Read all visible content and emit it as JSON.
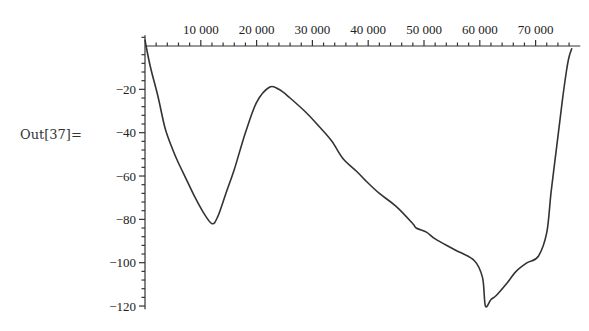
{
  "cell": {
    "out_label": "Out[37]="
  },
  "chart_data": {
    "type": "line",
    "title": "",
    "xlabel": "",
    "ylabel": "",
    "xlim": [
      0,
      78000
    ],
    "ylim": [
      -122,
      5
    ],
    "x_ticks": [
      10000,
      20000,
      30000,
      40000,
      50000,
      60000,
      70000
    ],
    "x_tick_labels": [
      "10 000",
      "20 000",
      "30 000",
      "40 000",
      "50 000",
      "60 000",
      "70 000"
    ],
    "y_ticks": [
      -20,
      -40,
      -60,
      -80,
      -100,
      -120
    ],
    "y_tick_labels": [
      "-20",
      "-40",
      "-60",
      "-80",
      "-100",
      "-120"
    ],
    "x_minor_step": 2000,
    "y_minor_step": 4,
    "grid": false,
    "legend": null,
    "series": [
      {
        "name": "curve",
        "color": "#333333",
        "points": [
          [
            0,
            3
          ],
          [
            200,
            0
          ],
          [
            1000,
            -10
          ],
          [
            2300,
            -23
          ],
          [
            3600,
            -38
          ],
          [
            5000,
            -48
          ],
          [
            6000,
            -54
          ],
          [
            7500,
            -62
          ],
          [
            9000,
            -70
          ],
          [
            10500,
            -77
          ],
          [
            12000,
            -82
          ],
          [
            13000,
            -79
          ],
          [
            14500,
            -68
          ],
          [
            16000,
            -57
          ],
          [
            18000,
            -40
          ],
          [
            20000,
            -26
          ],
          [
            22300,
            -19
          ],
          [
            24000,
            -20
          ],
          [
            26000,
            -24
          ],
          [
            29000,
            -31
          ],
          [
            31500,
            -38
          ],
          [
            33500,
            -44
          ],
          [
            35500,
            -52
          ],
          [
            38000,
            -58
          ],
          [
            39500,
            -62
          ],
          [
            42000,
            -68
          ],
          [
            45000,
            -74
          ],
          [
            48000,
            -82
          ],
          [
            48600,
            -84
          ],
          [
            50500,
            -86
          ],
          [
            52000,
            -89
          ],
          [
            55500,
            -94
          ],
          [
            59000,
            -99
          ],
          [
            60500,
            -107
          ],
          [
            61000,
            -120
          ],
          [
            62000,
            -117
          ],
          [
            63000,
            -115
          ],
          [
            65000,
            -109
          ],
          [
            66500,
            -104
          ],
          [
            68500,
            -100
          ],
          [
            70500,
            -97
          ],
          [
            72000,
            -86
          ],
          [
            72800,
            -67
          ],
          [
            73800,
            -46
          ],
          [
            74800,
            -25
          ],
          [
            75500,
            -12
          ],
          [
            76000,
            -5
          ],
          [
            76500,
            -1
          ]
        ]
      }
    ]
  }
}
